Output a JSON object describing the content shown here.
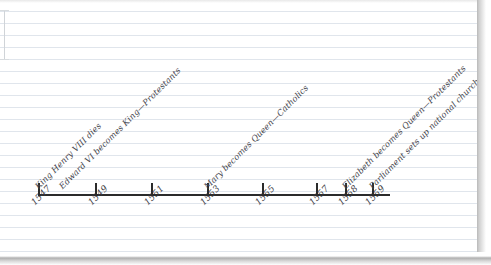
{
  "document": {
    "kind": "hand-drawn-timeline",
    "medium": "ruled-notebook-paper",
    "ink_color": "#2b2b2b",
    "paper_color": "#ffffff",
    "rule_color": "#dee4eb"
  },
  "chart_data": {
    "type": "timeline",
    "title": "",
    "xlabel": "",
    "ylabel": "",
    "axis_range": [
      1547,
      1560
    ],
    "grid": false,
    "legend": "none",
    "tick_labels": [
      "1547",
      "1549",
      "1551",
      "1553",
      "1555",
      "1557",
      "1558",
      "1559"
    ],
    "tick_values": [
      1547,
      1549,
      1551,
      1553,
      1555,
      1557,
      1558,
      1559
    ],
    "tick_x_px": [
      38,
      95,
      151,
      207,
      262,
      316,
      345,
      372
    ],
    "events": [
      {
        "year": 1547,
        "label": "King Henry VIII dies",
        "tick_x_px": 38
      },
      {
        "year": 1547,
        "label": "Edward VI becomes King—Protestants",
        "tick_x_px": 62
      },
      {
        "year": 1553,
        "label": "Mary becomes Queen—Catholics",
        "tick_x_px": 207
      },
      {
        "year": 1558,
        "label": "Elizabeth becomes Queen—Protestants",
        "tick_x_px": 345
      },
      {
        "year": 1559,
        "label": "Parliament sets up national church",
        "tick_x_px": 372
      }
    ]
  }
}
